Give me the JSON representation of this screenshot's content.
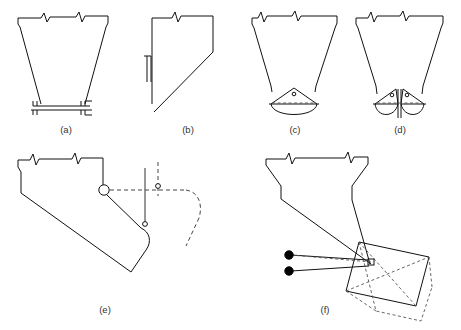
{
  "figure": {
    "background_color": "#ffffff",
    "line_color": "#111111",
    "dashed_color": "#444444",
    "panels": [
      {
        "id": "a",
        "label": "(a)",
        "name": "dragline-bucket-open-trapezoid",
        "label_x": 66,
        "label_y": 133
      },
      {
        "id": "b",
        "label": "(b)",
        "name": "bucket-half-section",
        "label_x": 188,
        "label_y": 133
      },
      {
        "id": "c",
        "label": "(c)",
        "name": "grab-bucket-single-rope",
        "label_x": 295,
        "label_y": 133
      },
      {
        "id": "d",
        "label": "(d)",
        "name": "clamshell-grab-bucket",
        "label_x": 400,
        "label_y": 133
      },
      {
        "id": "e",
        "label": "(e)",
        "name": "scraper-bucket-pivoting",
        "label_x": 105,
        "label_y": 313
      },
      {
        "id": "f",
        "label": "(f)",
        "name": "rectangular-skip-bucket-tipping",
        "label_x": 325,
        "label_y": 313
      }
    ],
    "break_symbol": "zigzag-break",
    "pivot_symbol": "open-circle-pivot",
    "anchor_symbol": "filled-circle-anchor"
  }
}
